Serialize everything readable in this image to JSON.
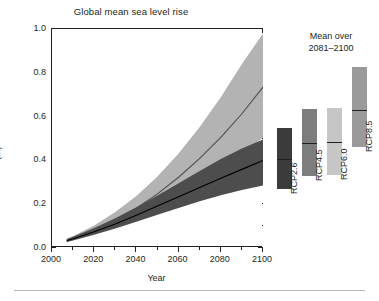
{
  "figure": {
    "title": "Global mean sea level rise",
    "right_panel_caption_line1": "Mean over",
    "right_panel_caption_line2": "2081–2100"
  },
  "chart_data": {
    "type": "area",
    "title": "Global mean sea level rise",
    "xlabel": "Year",
    "ylabel": "(m)",
    "xlim": [
      2000,
      2100
    ],
    "ylim": [
      0.0,
      1.0
    ],
    "grid": false,
    "legend": "none",
    "x_ticks": [
      2000,
      2020,
      2040,
      2060,
      2080,
      2100
    ],
    "x_ticks_minor": [
      2010,
      2030,
      2050,
      2070,
      2090
    ],
    "y_ticks": [
      0.0,
      0.2,
      0.4,
      0.6,
      0.8,
      1.0
    ],
    "y_ticks_minor": [
      0.1,
      0.3,
      0.5,
      0.7,
      0.9
    ],
    "x": [
      2007,
      2010,
      2020,
      2030,
      2040,
      2050,
      2060,
      2070,
      2080,
      2090,
      2100
    ],
    "series": [
      {
        "name": "RCP8.5",
        "color": "#b3b3b3",
        "median_color": "#4d4d4d",
        "median": [
          0.035,
          0.045,
          0.082,
          0.128,
          0.182,
          0.247,
          0.323,
          0.409,
          0.505,
          0.613,
          0.735
        ],
        "lower": [
          0.028,
          0.036,
          0.064,
          0.098,
          0.136,
          0.181,
          0.232,
          0.29,
          0.354,
          0.425,
          0.505
        ],
        "upper": [
          0.043,
          0.055,
          0.103,
          0.164,
          0.238,
          0.327,
          0.432,
          0.552,
          0.688,
          0.84,
          0.98
        ]
      },
      {
        "name": "RCP2.6",
        "color": "#4d4d4d",
        "median_color": "#000000",
        "median": [
          0.033,
          0.042,
          0.074,
          0.11,
          0.15,
          0.192,
          0.234,
          0.276,
          0.318,
          0.359,
          0.4
        ],
        "lower": [
          0.027,
          0.034,
          0.06,
          0.089,
          0.12,
          0.152,
          0.183,
          0.213,
          0.241,
          0.265,
          0.285
        ],
        "upper": [
          0.04,
          0.051,
          0.091,
          0.136,
          0.186,
          0.24,
          0.296,
          0.352,
          0.406,
          0.454,
          0.495
        ]
      }
    ],
    "summary_bars": {
      "caption": "Mean over 2081–2100",
      "unit": "m",
      "bars": [
        {
          "label": "RCP2.6",
          "color": "#3b3b3b",
          "low": 0.265,
          "median": 0.4,
          "high": 0.545
        },
        {
          "label": "RCP4.5",
          "color": "#7d7d7d",
          "low": 0.325,
          "median": 0.475,
          "high": 0.63
        },
        {
          "label": "RCP6.0",
          "color": "#c6c6c6",
          "low": 0.33,
          "median": 0.48,
          "high": 0.635
        },
        {
          "label": "RCP8.5",
          "color": "#9a9a9a",
          "low": 0.455,
          "median": 0.625,
          "high": 0.82
        }
      ]
    }
  }
}
